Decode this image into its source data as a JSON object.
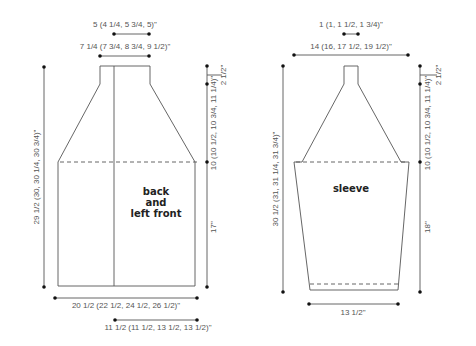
{
  "pieces": {
    "back": {
      "label_lines": [
        "back",
        "and",
        "left front"
      ],
      "dims": {
        "neck_width": "5 (4 1/4, 5 3/4, 5)\"",
        "shoulder_top_width": "7 1/4 (7 3/4, 8 3/4, 9 1/2)\"",
        "total_length": "29 1/2 (30, 30 1/4, 30 3/4)\"",
        "neck_depth": "2 1/2\"",
        "yoke_depth": "10 (10 1/2, 10 3/4, 11 1/4)\"",
        "body_length": "17\"",
        "bottom_width": "20 1/2 (22 1/2, 24 1/2, 26 1/2)\"",
        "front_width": "11 1/2 (11 1/2, 13 1/2, 13 1/2)\""
      }
    },
    "sleeve": {
      "label": "sleeve",
      "dims": {
        "top_width": "1 (1, 1 1/2, 1 3/4)\"",
        "upper_width": "14 (16, 17 1/2, 19 1/2)\"",
        "total_length": "30 1/2 (31, 31 1/4, 31 3/4)\"",
        "cap_top": "2 1/2\"",
        "cap_depth": "10 (10 1/2, 10 3/4, 11 1/4)\"",
        "arm_length": "18\"",
        "cuff_width": "13 1/2\""
      }
    }
  }
}
